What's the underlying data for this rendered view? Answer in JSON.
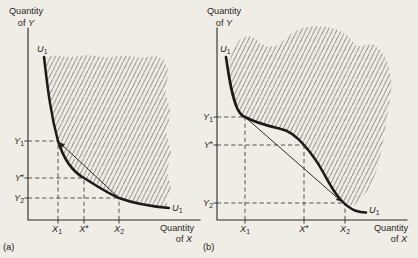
{
  "figure_type": "indifference-curve-diagram",
  "colors": {
    "paper_background": "#f0ede7",
    "ink": "#2a2722",
    "curve_ink": "#1d1b17",
    "hatch_line": "#4b4840"
  },
  "panel_a": {
    "caption": "(a)",
    "y_axis_title": {
      "line1": "Quantity",
      "prefix": "of ",
      "variable": "Y"
    },
    "x_axis_title": {
      "line1": "Quantity",
      "prefix": "of ",
      "variable": "X"
    },
    "curve_label": {
      "letter": "U",
      "sub": "1"
    },
    "y_marks": [
      {
        "letter": "Y",
        "sub": "1"
      },
      {
        "letter": "Y",
        "star": "*"
      },
      {
        "letter": "Y",
        "sub": "2"
      }
    ],
    "x_marks": [
      {
        "letter": "X",
        "sub": "1"
      },
      {
        "letter": "X",
        "star": "*"
      },
      {
        "letter": "X",
        "sub": "2"
      }
    ]
  },
  "panel_b": {
    "caption": "(b)",
    "y_axis_title": {
      "line1": "Quantity",
      "prefix": "of ",
      "variable": "Y"
    },
    "x_axis_title": {
      "line1": "Quantity",
      "prefix": "of ",
      "variable": "X"
    },
    "curve_label": {
      "letter": "U",
      "sub": "1"
    },
    "y_marks": [
      {
        "letter": "Y",
        "sub": "1"
      },
      {
        "letter": "Y",
        "star": "*"
      },
      {
        "letter": "Y",
        "sub": "2"
      }
    ],
    "x_marks": [
      {
        "letter": "X",
        "sub": "1"
      },
      {
        "letter": "X",
        "star": "*"
      },
      {
        "letter": "X",
        "sub": "2"
      }
    ]
  }
}
